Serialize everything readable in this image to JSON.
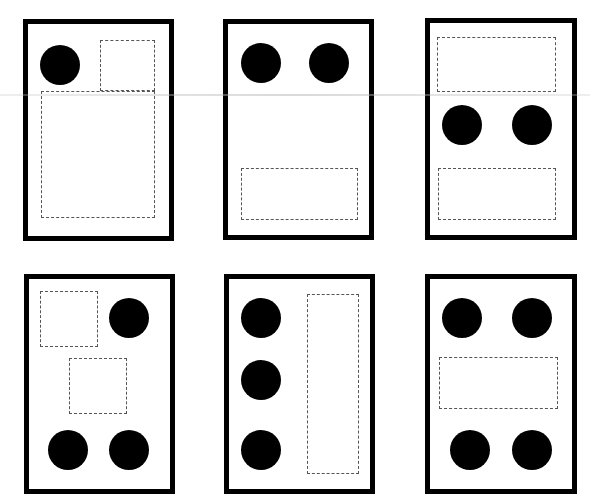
{
  "colors": {
    "card_border": "#000000",
    "dot": "#000000",
    "slot_border": "#555555",
    "background": "#ffffff"
  },
  "cards": [
    {
      "id": "card-1",
      "x": 23,
      "y": 19,
      "w": 151,
      "h": 222,
      "dots": [
        {
          "cx": 60,
          "cy": 65,
          "r": 20
        }
      ],
      "slots": [
        {
          "x": 100,
          "y": 40,
          "w": 55,
          "h": 51
        },
        {
          "x": 41,
          "y": 91,
          "w": 114,
          "h": 127
        }
      ]
    },
    {
      "id": "card-2",
      "x": 223,
      "y": 19,
      "w": 151,
      "h": 221,
      "dots": [
        {
          "cx": 261,
          "cy": 63,
          "r": 20
        },
        {
          "cx": 329,
          "cy": 63,
          "r": 20
        }
      ],
      "slots": [
        {
          "x": 241,
          "y": 168,
          "w": 117,
          "h": 52
        }
      ]
    },
    {
      "id": "card-3",
      "x": 425,
      "y": 18,
      "w": 152,
      "h": 222,
      "dots": [
        {
          "cx": 462,
          "cy": 125,
          "r": 20
        },
        {
          "cx": 532,
          "cy": 125,
          "r": 20
        }
      ],
      "slots": [
        {
          "x": 437,
          "y": 37,
          "w": 119,
          "h": 55
        },
        {
          "x": 438,
          "y": 168,
          "w": 118,
          "h": 52
        }
      ]
    },
    {
      "id": "card-4",
      "x": 24,
      "y": 274,
      "w": 151,
      "h": 220,
      "dots": [
        {
          "cx": 129,
          "cy": 318,
          "r": 20
        },
        {
          "cx": 68,
          "cy": 450,
          "r": 20
        },
        {
          "cx": 129,
          "cy": 450,
          "r": 20
        }
      ],
      "slots": [
        {
          "x": 40,
          "y": 291,
          "w": 58,
          "h": 56
        },
        {
          "x": 69,
          "y": 358,
          "w": 58,
          "h": 56
        }
      ]
    },
    {
      "id": "card-5",
      "x": 224,
      "y": 274,
      "w": 151,
      "h": 220,
      "dots": [
        {
          "cx": 261,
          "cy": 318,
          "r": 20
        },
        {
          "cx": 261,
          "cy": 380,
          "r": 20
        },
        {
          "cx": 261,
          "cy": 450,
          "r": 20
        }
      ],
      "slots": [
        {
          "x": 307,
          "y": 294,
          "w": 52,
          "h": 180
        }
      ]
    },
    {
      "id": "card-6",
      "x": 425,
      "y": 274,
      "w": 152,
      "h": 220,
      "dots": [
        {
          "cx": 462,
          "cy": 318,
          "r": 20
        },
        {
          "cx": 532,
          "cy": 318,
          "r": 20
        },
        {
          "cx": 470,
          "cy": 450,
          "r": 20
        },
        {
          "cx": 532,
          "cy": 450,
          "r": 20
        }
      ],
      "slots": [
        {
          "x": 439,
          "y": 357,
          "w": 119,
          "h": 52
        }
      ]
    }
  ],
  "artifact": {
    "scanline_y": 94
  }
}
